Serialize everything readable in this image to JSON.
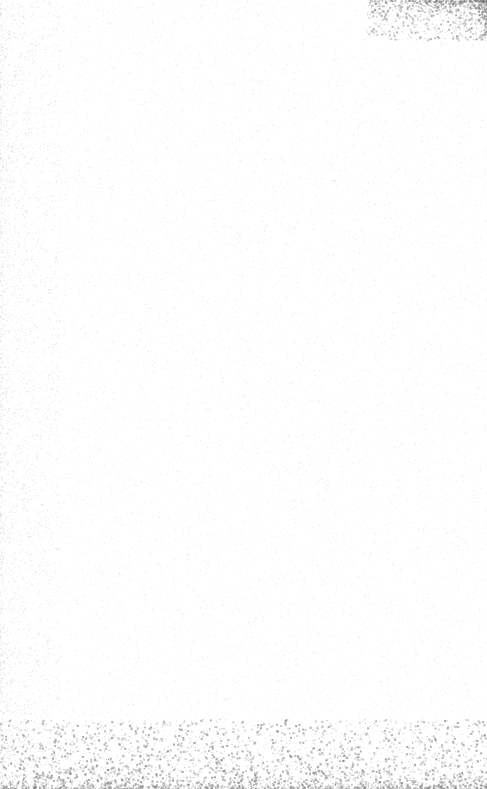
{
  "page": {
    "type": "blank-scanned-page",
    "text": "",
    "background_color": "#ffffff",
    "noise_color": "#9a9a9a"
  }
}
